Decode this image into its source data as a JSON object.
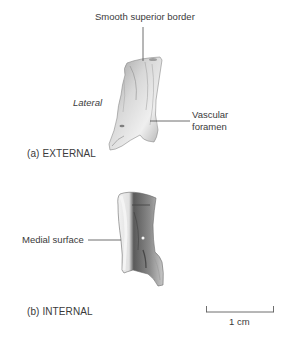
{
  "figure_a": {
    "caption": "(a) EXTERNAL",
    "labels": {
      "superior": "Smooth superior border",
      "lateral": "Lateral",
      "vascular_line1": "Vascular",
      "vascular_line2": "foramen"
    }
  },
  "figure_b": {
    "caption": "(b) INTERNAL",
    "labels": {
      "medial": "Medial surface"
    }
  },
  "scale_bar": {
    "label": "1 cm"
  },
  "colors": {
    "text": "#3a3a3a",
    "leader": "#4a4a4a",
    "bone_light": "#e6e6e6",
    "bone_mid": "#b5b5b5",
    "bone_dark": "#6e6e6e"
  }
}
